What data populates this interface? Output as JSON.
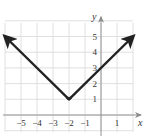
{
  "header": {
    "partial_label": ""
  },
  "chart_data": {
    "type": "line",
    "title": "",
    "equation": "y = |x + 2| + 1",
    "xlabel": "x",
    "ylabel": "y",
    "xlim": [
      -6,
      2
    ],
    "ylim": [
      -1,
      6
    ],
    "grid": true,
    "x_ticks": [
      -5,
      -4,
      -3,
      -2,
      -1,
      1
    ],
    "x_tick_labels": [
      "−5",
      "−4",
      "−3",
      "−2",
      "−1",
      "1"
    ],
    "y_ticks": [
      1,
      2,
      3,
      4,
      5
    ],
    "y_tick_labels": [
      "1",
      "2",
      "3",
      "4",
      "5"
    ],
    "series": [
      {
        "name": "V-shaped graph",
        "x": [
          -6,
          -2,
          2
        ],
        "y": [
          5,
          1,
          5
        ],
        "arrows": "both ends",
        "color": "#222222"
      }
    ],
    "vertex": [
      -2,
      1
    ]
  }
}
